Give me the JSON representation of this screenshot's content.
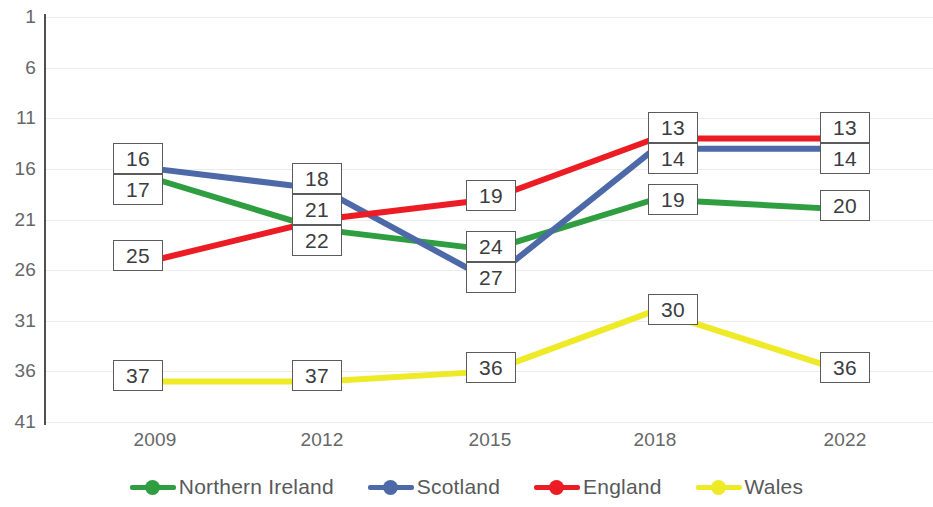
{
  "chart_data": {
    "type": "line",
    "title": "",
    "subtitle": "",
    "xlabel": "",
    "ylabel": "",
    "categories": [
      "2009",
      "2012",
      "2015",
      "2018",
      "2022"
    ],
    "x_tick_labels": [
      "2009",
      "2012",
      "2015",
      "2018",
      "2022"
    ],
    "y_tick_labels": [
      "1",
      "6",
      "11",
      "16",
      "21",
      "26",
      "31",
      "36",
      "41"
    ],
    "y_tick_values": [
      1,
      6,
      11,
      16,
      21,
      26,
      31,
      36,
      41
    ],
    "ylim": [
      1,
      41
    ],
    "y_axis_inverted": true,
    "grid": true,
    "legend_position": "bottom",
    "data_labels_shown": true,
    "series": [
      {
        "name": "Northern Ireland",
        "color": "#2f9e41",
        "values": [
          17,
          22,
          24,
          19,
          20
        ],
        "labels": [
          "17",
          "22",
          "24",
          "19",
          "20"
        ]
      },
      {
        "name": "Scotland",
        "color": "#4d69a8",
        "values": [
          16,
          18,
          27,
          14,
          14
        ],
        "labels": [
          "16",
          "18",
          "27",
          "14",
          "14"
        ]
      },
      {
        "name": "England",
        "color": "#ec1c24",
        "values": [
          25,
          21,
          19,
          13,
          13
        ],
        "labels": [
          "25",
          "21",
          "19",
          "13",
          "13"
        ]
      },
      {
        "name": "Wales",
        "color": "#eeea28",
        "values": [
          37,
          37,
          36,
          30,
          36
        ],
        "labels": [
          "37",
          "37",
          "36",
          "30",
          "36"
        ]
      }
    ]
  },
  "legend": {
    "items": [
      {
        "label": "Northern Ireland",
        "color": "#2f9e41",
        "marker": "line-dot-marker"
      },
      {
        "label": "Scotland",
        "color": "#4d69a8",
        "marker": "line-dot-marker"
      },
      {
        "label": "England",
        "color": "#ec1c24",
        "marker": "line-dot-marker"
      },
      {
        "label": "Wales",
        "color": "#eeea28",
        "marker": "line-dot-marker"
      }
    ]
  },
  "colors": {
    "northern_ireland": "#2f9e41",
    "scotland": "#4d69a8",
    "england": "#ec1c24",
    "wales": "#eeea28",
    "gridline": "#ececed",
    "axis": "#4f5052",
    "tick_text": "#666769",
    "label_border": "#5a5b5d"
  },
  "data_label_boxes": [
    {
      "text": "16",
      "series": "Scotland",
      "category": "2009"
    },
    {
      "text": "17",
      "series": "Northern Ireland",
      "category": "2009"
    },
    {
      "text": "25",
      "series": "England",
      "category": "2009"
    },
    {
      "text": "37",
      "series": "Wales",
      "category": "2009"
    },
    {
      "text": "18",
      "series": "Scotland",
      "category": "2012"
    },
    {
      "text": "21",
      "series": "England",
      "category": "2012"
    },
    {
      "text": "22",
      "series": "Northern Ireland",
      "category": "2012"
    },
    {
      "text": "37",
      "series": "Wales",
      "category": "2012"
    },
    {
      "text": "19",
      "series": "England",
      "category": "2015"
    },
    {
      "text": "24",
      "series": "Northern Ireland",
      "category": "2015"
    },
    {
      "text": "27",
      "series": "Scotland",
      "category": "2015"
    },
    {
      "text": "36",
      "series": "Wales",
      "category": "2015"
    },
    {
      "text": "13",
      "series": "England",
      "category": "2018"
    },
    {
      "text": "14",
      "series": "Scotland",
      "category": "2018"
    },
    {
      "text": "19",
      "series": "Northern Ireland",
      "category": "2018"
    },
    {
      "text": "30",
      "series": "Wales",
      "category": "2018"
    },
    {
      "text": "13",
      "series": "England",
      "category": "2022"
    },
    {
      "text": "14",
      "series": "Scotland",
      "category": "2022"
    },
    {
      "text": "20",
      "series": "Northern Ireland",
      "category": "2022"
    },
    {
      "text": "36",
      "series": "Wales",
      "category": "2022"
    }
  ]
}
